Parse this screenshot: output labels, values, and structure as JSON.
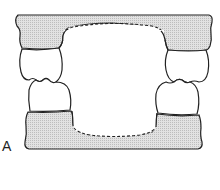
{
  "figure": {
    "label": "A",
    "colors": {
      "gum_fill": "#d9d9d9",
      "stroke": "#222222",
      "tooth_fill": "#ffffff",
      "background": "#ffffff"
    },
    "parts": [
      "upper-gingiva",
      "lower-gingiva",
      "upper-left-tooth",
      "lower-left-tooth",
      "upper-right-tooth",
      "lower-right-tooth",
      "upper-dashed-ridge",
      "lower-dashed-ridge"
    ]
  }
}
